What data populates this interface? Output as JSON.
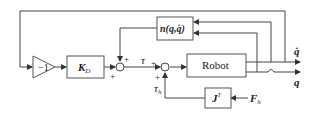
{
  "diagram": {
    "type": "control-block-diagram",
    "blocks": {
      "gain": {
        "label": "−1"
      },
      "kd": {
        "label_main": "K",
        "label_sub": "D"
      },
      "nonlinear": {
        "label": "n(q,q̇)"
      },
      "robot": {
        "label": "Robot"
      },
      "jacobian": {
        "label_main": "J",
        "label_sup": "T"
      }
    },
    "signals": {
      "tau": "τ",
      "tau_h_main": "τ",
      "tau_h_sub": "h",
      "force_main": "F",
      "force_sub": "h",
      "q_dot": "q̇",
      "q": "q"
    },
    "sum_signs": {
      "sum1_top": "+",
      "sum1_left": "+",
      "sum2_left": "+",
      "sum2_bottom": "+"
    },
    "colors": {
      "line": "#444444",
      "block_border": "#555555",
      "text": "#222222"
    }
  }
}
